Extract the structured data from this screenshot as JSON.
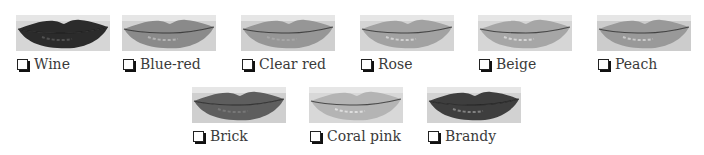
{
  "swatches": [
    {
      "label": "Wine",
      "checked": false,
      "tone": "#2b2b2b",
      "highlight": "#555555",
      "skin": "#d6d6d6"
    },
    {
      "label": "Blue-red",
      "checked": false,
      "tone": "#8a8a8a",
      "highlight": "#b8b8b8",
      "skin": "#d2d2d2"
    },
    {
      "label": "Clear red",
      "checked": false,
      "tone": "#969696",
      "highlight": "#a8a8a8",
      "skin": "#cfcfcf"
    },
    {
      "label": "Rose",
      "checked": false,
      "tone": "#a2a2a2",
      "highlight": "#d6d6d6",
      "skin": "#d4d4d4"
    },
    {
      "label": "Beige",
      "checked": false,
      "tone": "#a6a6a6",
      "highlight": "#dadada",
      "skin": "#d6d6d6"
    },
    {
      "label": "Peach",
      "checked": false,
      "tone": "#999999",
      "highlight": "#cfcfcf",
      "skin": "#cccccc"
    },
    {
      "label": "Brick",
      "checked": false,
      "tone": "#5e5e5e",
      "highlight": "#7a7a7a",
      "skin": "#cfcfcf"
    },
    {
      "label": "Coral pink",
      "checked": false,
      "tone": "#b4b4b4",
      "highlight": "#e2e2e2",
      "skin": "#d8d8d8"
    },
    {
      "label": "Brandy",
      "checked": false,
      "tone": "#3e3e3e",
      "highlight": "#8a8a8a",
      "skin": "#d2d2d2"
    }
  ]
}
